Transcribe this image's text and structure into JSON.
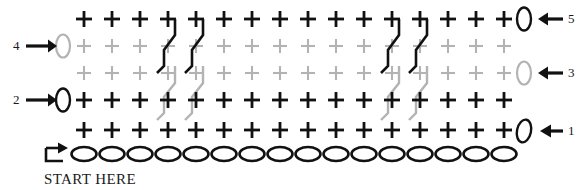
{
  "chart": {
    "kind": "knitting-stitch-chart",
    "grid": {
      "columns": 16,
      "stitch_rows": 5,
      "cast_on_row": true,
      "cast_on_symbol": "oval",
      "stitch_symbol": "plus",
      "col_spacing_px": 28,
      "row_spacing_px": 27,
      "origin_x_px": 84,
      "origin_y_px": 19
    },
    "row_colors": {
      "row1": "#111111",
      "row2": "#111111",
      "row3": "#b3b3b3",
      "row4": "#b3b3b3",
      "row5": "#111111",
      "cast_on": "#111111"
    },
    "colors": {
      "dark": "#111111",
      "light": "#b3b3b3",
      "text": "#1a1a1a",
      "background": "#ffffff"
    },
    "row_labels_left": [
      {
        "text": "4",
        "row": 4,
        "marker": "oval",
        "marker_color": "#b3b3b3",
        "arrow": "right-arrow"
      },
      {
        "text": "2",
        "row": 2,
        "marker": "oval",
        "marker_color": "#111111",
        "arrow": "right-arrow"
      }
    ],
    "row_labels_right": [
      {
        "text": "5",
        "row": 5,
        "marker": "oval",
        "marker_color": "#111111",
        "arrow": "left-arrow"
      },
      {
        "text": "3",
        "row": 3,
        "marker": "oval",
        "marker_color": "#b3b3b3",
        "arrow": "left-arrow"
      },
      {
        "text": "1",
        "row": 1,
        "marker": "oval",
        "marker_color": "#111111",
        "arrow": "left-arrow"
      }
    ],
    "start": {
      "label": "START HERE",
      "marker": "turn-arrow",
      "marker_color": "#111111"
    },
    "cables": [
      {
        "id": "cable-dark-left-a",
        "color": "#111111",
        "column": 4,
        "top_row": 5,
        "bottom_row": 3,
        "lean": "left"
      },
      {
        "id": "cable-dark-left-b",
        "color": "#111111",
        "column": 5,
        "top_row": 5,
        "bottom_row": 3,
        "lean": "left"
      },
      {
        "id": "cable-light-left-a",
        "color": "#b3b3b3",
        "column": 4,
        "top_row": 3,
        "bottom_row": 1,
        "lean": "left"
      },
      {
        "id": "cable-light-left-b",
        "color": "#b3b3b3",
        "column": 5,
        "top_row": 3,
        "bottom_row": 1,
        "lean": "left"
      },
      {
        "id": "cable-dark-right-a",
        "color": "#111111",
        "column": 12,
        "top_row": 5,
        "bottom_row": 3,
        "lean": "left"
      },
      {
        "id": "cable-dark-right-b",
        "color": "#111111",
        "column": 13,
        "top_row": 5,
        "bottom_row": 3,
        "lean": "left"
      },
      {
        "id": "cable-light-right-a",
        "color": "#b3b3b3",
        "column": 12,
        "top_row": 3,
        "bottom_row": 1,
        "lean": "left"
      },
      {
        "id": "cable-light-right-b",
        "color": "#b3b3b3",
        "column": 13,
        "top_row": 3,
        "bottom_row": 1,
        "lean": "left"
      }
    ]
  }
}
